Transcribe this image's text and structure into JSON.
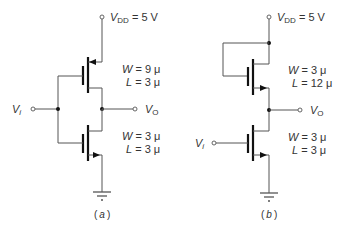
{
  "figure": {
    "circuit_a": {
      "caption": "a",
      "supply": {
        "symbol": "V",
        "subscript": "DD",
        "value": " = 5 V"
      },
      "input": {
        "symbol": "V",
        "subscript": "i"
      },
      "output": {
        "symbol": "V",
        "subscript": "O"
      },
      "upper_transistor": {
        "type": "PMOS",
        "W_sym": "W",
        "W_val": " = 9 μ",
        "L_sym": "L",
        "L_val": " = 3 μ"
      },
      "lower_transistor": {
        "type": "NMOS",
        "W_sym": "W",
        "W_val": " = 3 μ",
        "L_sym": "L",
        "L_val": " = 3 μ"
      }
    },
    "circuit_b": {
      "caption": "b",
      "supply": {
        "symbol": "V",
        "subscript": "DD",
        "value": " = 5 V"
      },
      "input": {
        "symbol": "V",
        "subscript": "i"
      },
      "output": {
        "symbol": "V",
        "subscript": "O"
      },
      "upper_transistor": {
        "type": "NMOS load (diode-connected)",
        "W_sym": "W",
        "W_val": " = 3 μ",
        "L_sym": "L",
        "L_val": " = 12 μ"
      },
      "lower_transistor": {
        "type": "NMOS",
        "W_sym": "W",
        "W_val": " = 3 μ",
        "L_sym": "L",
        "L_val": " = 3 μ"
      }
    },
    "paren_open": "(",
    "paren_close": ")"
  }
}
